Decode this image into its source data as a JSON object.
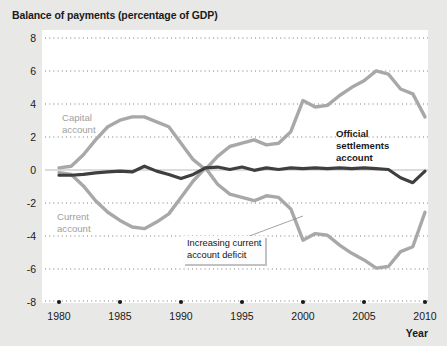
{
  "figure": {
    "title": "Balance of payments (percentage of GDP)",
    "background_color": "#e8e8e6",
    "plot_background_color": "#ffffff"
  },
  "chart_data": {
    "type": "line",
    "title": "Balance of payments (percentage of GDP)",
    "xlabel": "Year",
    "ylabel": "",
    "xlim": [
      1979,
      2010.5
    ],
    "ylim": [
      -8,
      8
    ],
    "xticks": [
      1980,
      1985,
      1990,
      1995,
      2000,
      2005,
      2010
    ],
    "xtick_labels": [
      "1980",
      "1985",
      "1990",
      "1995",
      "2000",
      "2005",
      "2010"
    ],
    "yticks": [
      8,
      6,
      4,
      2,
      0,
      -2,
      -4,
      -6,
      -8
    ],
    "ytick_labels": [
      "8",
      "6",
      "4",
      "2",
      "0",
      "-2",
      "-4",
      "-6",
      "-8"
    ],
    "grid": "horizontal-dotted",
    "legend_position": "inline-labels",
    "x": [
      1980,
      1981,
      1982,
      1983,
      1984,
      1985,
      1986,
      1987,
      1988,
      1989,
      1990,
      1991,
      1992,
      1993,
      1994,
      1995,
      1996,
      1997,
      1998,
      1999,
      2000,
      2001,
      2002,
      2003,
      2004,
      2005,
      2006,
      2007,
      2008,
      2009,
      2010
    ],
    "series": [
      {
        "name": "Capital account",
        "color": "#a8a8a8",
        "values": [
          0.1,
          0.2,
          0.9,
          1.8,
          2.6,
          3.0,
          3.2,
          3.2,
          2.9,
          2.6,
          1.6,
          0.6,
          0.0,
          0.8,
          1.4,
          1.6,
          1.8,
          1.5,
          1.6,
          2.3,
          4.2,
          3.8,
          3.9,
          4.5,
          5.0,
          5.4,
          6.0,
          5.8,
          4.9,
          4.6,
          3.2
        ],
        "label_position": "upper-left"
      },
      {
        "name": "Current account",
        "color": "#a8a8a8",
        "values": [
          -0.2,
          -0.3,
          -1.0,
          -1.9,
          -2.6,
          -3.1,
          -3.5,
          -3.6,
          -3.2,
          -2.7,
          -1.7,
          -0.7,
          0.1,
          -0.9,
          -1.5,
          -1.7,
          -1.9,
          -1.6,
          -1.7,
          -2.4,
          -4.3,
          -3.9,
          -4.0,
          -4.6,
          -5.1,
          -5.5,
          -6.0,
          -5.9,
          -5.0,
          -4.7,
          -2.6
        ],
        "label_position": "lower-left"
      },
      {
        "name": "Official settlements account",
        "color": "#3f3f3f",
        "values": [
          -0.35,
          -0.35,
          -0.3,
          -0.2,
          -0.15,
          -0.1,
          -0.15,
          0.2,
          -0.1,
          -0.3,
          -0.55,
          -0.3,
          0.1,
          0.15,
          0.0,
          0.15,
          -0.05,
          0.1,
          0.0,
          0.1,
          0.05,
          0.1,
          0.05,
          0.1,
          0.05,
          0.1,
          0.05,
          0.0,
          -0.5,
          -0.8,
          -0.1
        ],
        "label_position": "right-center"
      }
    ],
    "annotations": [
      {
        "text_lines": [
          "Increasing current",
          "account deficit"
        ],
        "target_series": "Current account",
        "points_to_year": 2000
      }
    ]
  },
  "series_labels": {
    "capital": {
      "line1": "Capital",
      "line2": "account"
    },
    "current": {
      "line1": "Current",
      "line2": "account"
    },
    "official": {
      "line1": "Official",
      "line2": "settlements",
      "line3": "account"
    }
  },
  "annotation": {
    "line1": "Increasing current",
    "line2": "account deficit"
  },
  "axis": {
    "x_axis_title": "Year"
  }
}
